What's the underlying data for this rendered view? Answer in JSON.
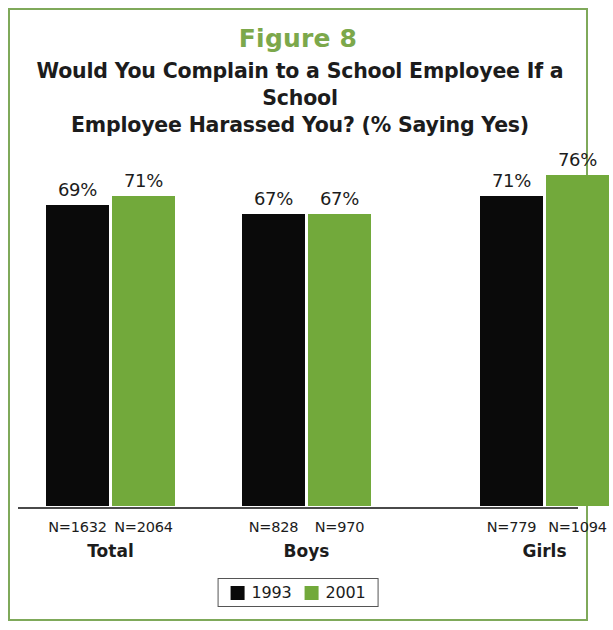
{
  "figure": {
    "label": "Figure 8",
    "title_line_1": "Would You Complain to a School Employee If a School",
    "title_line_2": "Employee Harassed You? (% Saying Yes)"
  },
  "colors": {
    "accent_green": "#72A93B",
    "title_green": "#7CA84B",
    "frame_green": "#7FA95A",
    "series_1993": "#0a0a0a",
    "text": "#1c1c1c"
  },
  "legend": {
    "items": [
      {
        "label": "1993",
        "color": "#0a0a0a"
      },
      {
        "label": "2001",
        "color": "#72A93B"
      }
    ]
  },
  "chart_data": {
    "type": "bar",
    "title": "Would You Complain to a School Employee If a School Employee Harassed You? (% Saying Yes)",
    "subtitle": "Figure 8",
    "xlabel": "",
    "ylabel": "",
    "ylim": [
      0,
      100
    ],
    "grid": false,
    "legend_position": "bottom",
    "categories": [
      "Total",
      "Boys",
      "Girls"
    ],
    "series": [
      {
        "name": "1993",
        "color": "#0a0a0a",
        "values": [
          69,
          67,
          71
        ],
        "value_labels": [
          "69%",
          "67%",
          "71%"
        ],
        "n_labels": [
          "N=1632",
          "N=828",
          "N=779"
        ]
      },
      {
        "name": "2001",
        "color": "#72A93B",
        "values": [
          71,
          67,
          76
        ],
        "value_labels": [
          "71%",
          "67%",
          "76%"
        ],
        "n_labels": [
          "N=2064",
          "N=970",
          "N=1094"
        ]
      }
    ]
  }
}
